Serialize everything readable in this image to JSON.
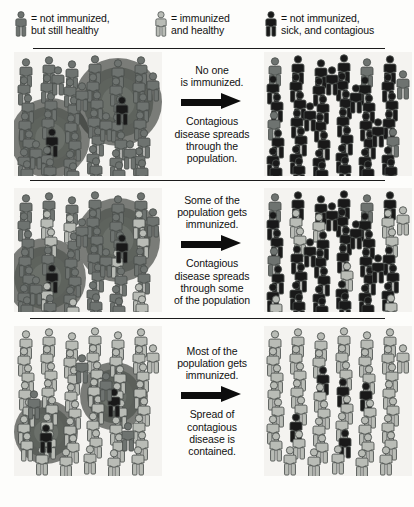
{
  "legend": {
    "items": [
      {
        "icon": "person-icon-healthy-unimmunized",
        "state": "unimmunized_healthy",
        "color": "#6e7370",
        "label": "= not immunized,\nbut still healthy"
      },
      {
        "icon": "person-icon-immunized",
        "state": "immunized_healthy",
        "color": "#b9bcb6",
        "label": "= immunized\nand healthy"
      },
      {
        "icon": "person-icon-sick",
        "state": "sick_contagious",
        "color": "#191919",
        "label": "= not immunized,\nsick, and contagious"
      }
    ]
  },
  "colors": {
    "unimmunized_healthy": "#6e7370",
    "immunized_healthy": "#b9bcb6",
    "sick_contagious": "#191919",
    "outline": "#4a4f4c",
    "panel_background": "#f4f3f0",
    "divider": "#1b1b1b",
    "arrow": "#0d0d0d",
    "text": "#111111"
  },
  "rows": [
    {
      "id": "row-no-immunization",
      "heading": "No one\nis immunized.",
      "arrow_icon": "right-arrow-icon",
      "caption": "Contagious\ndisease spreads\nthrough the\npopulation.",
      "left_panel": {
        "name": "before-panel-row1",
        "counts": {
          "unimmunized_healthy": 46,
          "immunized_healthy": 0,
          "sick_contagious": 2
        },
        "halos": [
          {
            "cx": 36,
            "cy": 86,
            "r": 40
          },
          {
            "cx": 104,
            "cy": 50,
            "r": 44
          }
        ]
      },
      "right_panel": {
        "name": "after-panel-row1",
        "counts": {
          "unimmunized_healthy": 6,
          "immunized_healthy": 0,
          "sick_contagious": 42
        }
      }
    },
    {
      "id": "row-some-immunized",
      "heading": "Some of the\npopulation gets\nimmunized.",
      "arrow_icon": "right-arrow-icon",
      "caption": "Contagious\ndisease spreads\nthrough some\nof the population",
      "left_panel": {
        "name": "before-panel-row2",
        "counts": {
          "unimmunized_healthy": 34,
          "immunized_healthy": 10,
          "sick_contagious": 2
        },
        "halos": [
          {
            "cx": 32,
            "cy": 90,
            "r": 40
          },
          {
            "cx": 104,
            "cy": 52,
            "r": 42
          }
        ]
      },
      "right_panel": {
        "name": "after-panel-row2",
        "counts": {
          "unimmunized_healthy": 3,
          "immunized_healthy": 10,
          "sick_contagious": 35
        }
      }
    },
    {
      "id": "row-most-immunized",
      "heading": "Most of the\npopulation gets\nimmunized.",
      "arrow_icon": "right-arrow-icon",
      "caption": "Spread of\ncontagious\ndisease is\ncontained.",
      "left_panel": {
        "name": "before-panel-row3",
        "counts": {
          "unimmunized_healthy": 4,
          "immunized_healthy": 44,
          "sick_contagious": 2
        },
        "halos": [
          {
            "cx": 32,
            "cy": 106,
            "r": 32
          },
          {
            "cx": 100,
            "cy": 70,
            "r": 34
          }
        ]
      },
      "right_panel": {
        "name": "after-panel-row3",
        "counts": {
          "unimmunized_healthy": 0,
          "immunized_healthy": 46,
          "sick_contagious": 5
        }
      }
    }
  ],
  "figures": {
    "row0_left": [
      [
        4,
        6,
        "u"
      ],
      [
        27,
        4,
        "u"
      ],
      [
        50,
        8,
        "u"
      ],
      [
        73,
        3,
        "u"
      ],
      [
        96,
        7,
        "u"
      ],
      [
        119,
        4,
        "u"
      ],
      [
        131,
        20,
        "u"
      ],
      [
        2,
        24,
        "u"
      ],
      [
        25,
        22,
        "u"
      ],
      [
        48,
        26,
        "u"
      ],
      [
        71,
        21,
        "u"
      ],
      [
        94,
        25,
        "u"
      ],
      [
        117,
        22,
        "u"
      ],
      [
        6,
        42,
        "u"
      ],
      [
        29,
        40,
        "u"
      ],
      [
        52,
        44,
        "u"
      ],
      [
        75,
        39,
        "u"
      ],
      [
        98,
        43,
        "u"
      ],
      [
        121,
        41,
        "u"
      ],
      [
        3,
        60,
        "u"
      ],
      [
        26,
        58,
        "u"
      ],
      [
        49,
        62,
        "u"
      ],
      [
        72,
        57,
        "u"
      ],
      [
        95,
        61,
        "u"
      ],
      [
        118,
        59,
        "u"
      ],
      [
        7,
        78,
        "u"
      ],
      [
        30,
        76,
        "s"
      ],
      [
        53,
        80,
        "u"
      ],
      [
        76,
        75,
        "u"
      ],
      [
        99,
        79,
        "u"
      ],
      [
        122,
        77,
        "u"
      ],
      [
        2,
        96,
        "u"
      ],
      [
        25,
        94,
        "u"
      ],
      [
        48,
        98,
        "u"
      ],
      [
        71,
        93,
        "u"
      ],
      [
        94,
        97,
        "u"
      ],
      [
        117,
        95,
        "u"
      ],
      [
        5,
        108,
        "u"
      ],
      [
        28,
        106,
        "u"
      ],
      [
        51,
        110,
        "u"
      ],
      [
        74,
        105,
        "u"
      ],
      [
        97,
        109,
        "u"
      ],
      [
        120,
        107,
        "u"
      ],
      [
        100,
        44,
        "s"
      ],
      [
        14,
        88,
        "u"
      ],
      [
        60,
        30,
        "u"
      ],
      [
        84,
        60,
        "u"
      ],
      [
        36,
        14,
        "u"
      ],
      [
        108,
        88,
        "u"
      ]
    ],
    "row0_right": [
      [
        3,
        5,
        "u"
      ],
      [
        26,
        3,
        "s"
      ],
      [
        49,
        7,
        "s"
      ],
      [
        72,
        2,
        "s"
      ],
      [
        95,
        6,
        "u"
      ],
      [
        118,
        3,
        "s"
      ],
      [
        131,
        18,
        "u"
      ],
      [
        1,
        23,
        "s"
      ],
      [
        24,
        21,
        "s"
      ],
      [
        47,
        25,
        "s"
      ],
      [
        70,
        20,
        "s"
      ],
      [
        93,
        24,
        "s"
      ],
      [
        116,
        21,
        "s"
      ],
      [
        5,
        41,
        "s"
      ],
      [
        28,
        39,
        "s"
      ],
      [
        51,
        43,
        "s"
      ],
      [
        74,
        38,
        "s"
      ],
      [
        97,
        42,
        "s"
      ],
      [
        120,
        40,
        "s"
      ],
      [
        2,
        59,
        "u"
      ],
      [
        25,
        57,
        "s"
      ],
      [
        48,
        61,
        "s"
      ],
      [
        71,
        56,
        "s"
      ],
      [
        94,
        60,
        "s"
      ],
      [
        117,
        58,
        "s"
      ],
      [
        6,
        77,
        "s"
      ],
      [
        29,
        75,
        "s"
      ],
      [
        52,
        79,
        "s"
      ],
      [
        75,
        74,
        "s"
      ],
      [
        98,
        78,
        "s"
      ],
      [
        121,
        76,
        "u"
      ],
      [
        1,
        95,
        "s"
      ],
      [
        24,
        93,
        "s"
      ],
      [
        47,
        97,
        "s"
      ],
      [
        70,
        92,
        "s"
      ],
      [
        93,
        96,
        "s"
      ],
      [
        116,
        94,
        "s"
      ],
      [
        4,
        107,
        "s"
      ],
      [
        27,
        105,
        "s"
      ],
      [
        50,
        109,
        "s"
      ],
      [
        73,
        104,
        "s"
      ],
      [
        96,
        108,
        "s"
      ],
      [
        119,
        106,
        "s"
      ],
      [
        60,
        14,
        "s"
      ],
      [
        84,
        32,
        "s"
      ],
      [
        38,
        50,
        "s"
      ],
      [
        106,
        66,
        "s"
      ]
    ],
    "row1_left": [
      [
        4,
        6,
        "u"
      ],
      [
        27,
        4,
        "u"
      ],
      [
        50,
        8,
        "u"
      ],
      [
        73,
        3,
        "u"
      ],
      [
        96,
        7,
        "u"
      ],
      [
        119,
        4,
        "u"
      ],
      [
        131,
        20,
        "u"
      ],
      [
        2,
        24,
        "u"
      ],
      [
        25,
        22,
        "i"
      ],
      [
        48,
        26,
        "i"
      ],
      [
        71,
        21,
        "u"
      ],
      [
        94,
        25,
        "u"
      ],
      [
        117,
        22,
        "i"
      ],
      [
        6,
        42,
        "u"
      ],
      [
        29,
        40,
        "i"
      ],
      [
        52,
        44,
        "u"
      ],
      [
        75,
        39,
        "u"
      ],
      [
        98,
        43,
        "u"
      ],
      [
        121,
        41,
        "i"
      ],
      [
        3,
        60,
        "u"
      ],
      [
        26,
        58,
        "u"
      ],
      [
        49,
        62,
        "u"
      ],
      [
        72,
        57,
        "u"
      ],
      [
        95,
        61,
        "i"
      ],
      [
        118,
        59,
        "u"
      ],
      [
        7,
        78,
        "u"
      ],
      [
        30,
        76,
        "s"
      ],
      [
        53,
        80,
        "u"
      ],
      [
        76,
        75,
        "u"
      ],
      [
        99,
        79,
        "u"
      ],
      [
        122,
        77,
        "u"
      ],
      [
        2,
        96,
        "u"
      ],
      [
        25,
        94,
        "i"
      ],
      [
        48,
        98,
        "u"
      ],
      [
        71,
        93,
        "u"
      ],
      [
        94,
        97,
        "u"
      ],
      [
        117,
        95,
        "i"
      ],
      [
        5,
        108,
        "u"
      ],
      [
        28,
        106,
        "u"
      ],
      [
        51,
        110,
        "i"
      ],
      [
        74,
        105,
        "u"
      ],
      [
        97,
        109,
        "u"
      ],
      [
        120,
        107,
        "i"
      ],
      [
        100,
        46,
        "s"
      ],
      [
        14,
        88,
        "u"
      ],
      [
        60,
        30,
        "u"
      ],
      [
        84,
        60,
        "u"
      ]
    ],
    "row1_right": [
      [
        3,
        5,
        "u"
      ],
      [
        26,
        3,
        "s"
      ],
      [
        49,
        7,
        "s"
      ],
      [
        72,
        2,
        "s"
      ],
      [
        95,
        6,
        "u"
      ],
      [
        118,
        3,
        "s"
      ],
      [
        131,
        18,
        "i"
      ],
      [
        1,
        23,
        "s"
      ],
      [
        24,
        21,
        "i"
      ],
      [
        47,
        25,
        "i"
      ],
      [
        70,
        20,
        "s"
      ],
      [
        93,
        24,
        "s"
      ],
      [
        116,
        21,
        "i"
      ],
      [
        5,
        41,
        "s"
      ],
      [
        28,
        39,
        "i"
      ],
      [
        51,
        43,
        "s"
      ],
      [
        74,
        38,
        "s"
      ],
      [
        97,
        42,
        "s"
      ],
      [
        120,
        40,
        "i"
      ],
      [
        2,
        59,
        "u"
      ],
      [
        25,
        57,
        "s"
      ],
      [
        48,
        61,
        "s"
      ],
      [
        71,
        56,
        "s"
      ],
      [
        94,
        60,
        "s"
      ],
      [
        117,
        58,
        "s"
      ],
      [
        6,
        77,
        "s"
      ],
      [
        29,
        75,
        "s"
      ],
      [
        52,
        79,
        "s"
      ],
      [
        75,
        74,
        "i"
      ],
      [
        98,
        78,
        "s"
      ],
      [
        121,
        76,
        "s"
      ],
      [
        1,
        95,
        "s"
      ],
      [
        24,
        93,
        "s"
      ],
      [
        47,
        97,
        "s"
      ],
      [
        70,
        92,
        "s"
      ],
      [
        93,
        96,
        "s"
      ],
      [
        116,
        94,
        "s"
      ],
      [
        4,
        107,
        "i"
      ],
      [
        27,
        105,
        "s"
      ],
      [
        50,
        109,
        "s"
      ],
      [
        73,
        104,
        "s"
      ],
      [
        96,
        108,
        "s"
      ],
      [
        119,
        106,
        "i"
      ],
      [
        60,
        14,
        "s"
      ],
      [
        84,
        32,
        "s"
      ],
      [
        38,
        50,
        "s"
      ],
      [
        106,
        66,
        "s"
      ]
    ],
    "row2_left": [
      [
        4,
        4,
        "i"
      ],
      [
        27,
        2,
        "i"
      ],
      [
        50,
        6,
        "i"
      ],
      [
        73,
        1,
        "i"
      ],
      [
        96,
        5,
        "i"
      ],
      [
        119,
        2,
        "i"
      ],
      [
        131,
        18,
        "i"
      ],
      [
        2,
        21,
        "i"
      ],
      [
        25,
        19,
        "i"
      ],
      [
        48,
        23,
        "i"
      ],
      [
        71,
        18,
        "i"
      ],
      [
        94,
        22,
        "i"
      ],
      [
        117,
        19,
        "i"
      ],
      [
        6,
        38,
        "i"
      ],
      [
        29,
        36,
        "i"
      ],
      [
        52,
        40,
        "i"
      ],
      [
        75,
        35,
        "i"
      ],
      [
        98,
        39,
        "i"
      ],
      [
        121,
        37,
        "i"
      ],
      [
        3,
        55,
        "i"
      ],
      [
        26,
        53,
        "i"
      ],
      [
        49,
        57,
        "i"
      ],
      [
        72,
        52,
        "i"
      ],
      [
        95,
        56,
        "i"
      ],
      [
        118,
        54,
        "i"
      ],
      [
        7,
        72,
        "i"
      ],
      [
        30,
        70,
        "i"
      ],
      [
        53,
        74,
        "i"
      ],
      [
        76,
        69,
        "i"
      ],
      [
        99,
        73,
        "i"
      ],
      [
        122,
        71,
        "i"
      ],
      [
        2,
        89,
        "i"
      ],
      [
        25,
        87,
        "i"
      ],
      [
        48,
        91,
        "i"
      ],
      [
        71,
        86,
        "i"
      ],
      [
        94,
        90,
        "i"
      ],
      [
        117,
        88,
        "i"
      ],
      [
        5,
        106,
        "i"
      ],
      [
        28,
        104,
        "i"
      ],
      [
        51,
        108,
        "i"
      ],
      [
        74,
        103,
        "i"
      ],
      [
        97,
        107,
        "i"
      ],
      [
        120,
        105,
        "i"
      ],
      [
        20,
        120,
        "i"
      ],
      [
        44,
        122,
        "i"
      ],
      [
        68,
        119,
        "i"
      ],
      [
        92,
        123,
        "i"
      ],
      [
        116,
        120,
        "i"
      ],
      [
        24,
        98,
        "s"
      ],
      [
        92,
        62,
        "s"
      ],
      [
        60,
        28,
        "u"
      ],
      [
        84,
        46,
        "u"
      ],
      [
        12,
        64,
        "u"
      ],
      [
        106,
        96,
        "u"
      ]
    ],
    "row2_right": [
      [
        3,
        4,
        "i"
      ],
      [
        26,
        2,
        "i"
      ],
      [
        49,
        6,
        "i"
      ],
      [
        72,
        1,
        "i"
      ],
      [
        95,
        5,
        "i"
      ],
      [
        118,
        2,
        "i"
      ],
      [
        131,
        18,
        "i"
      ],
      [
        1,
        21,
        "i"
      ],
      [
        24,
        19,
        "i"
      ],
      [
        47,
        23,
        "i"
      ],
      [
        70,
        18,
        "i"
      ],
      [
        93,
        22,
        "i"
      ],
      [
        116,
        19,
        "i"
      ],
      [
        5,
        38,
        "i"
      ],
      [
        28,
        36,
        "i"
      ],
      [
        51,
        40,
        "s"
      ],
      [
        74,
        35,
        "i"
      ],
      [
        97,
        39,
        "i"
      ],
      [
        120,
        37,
        "i"
      ],
      [
        2,
        55,
        "i"
      ],
      [
        25,
        53,
        "i"
      ],
      [
        48,
        57,
        "i"
      ],
      [
        71,
        52,
        "s"
      ],
      [
        94,
        56,
        "s"
      ],
      [
        117,
        54,
        "i"
      ],
      [
        6,
        72,
        "i"
      ],
      [
        29,
        70,
        "i"
      ],
      [
        52,
        74,
        "i"
      ],
      [
        75,
        69,
        "i"
      ],
      [
        98,
        73,
        "i"
      ],
      [
        121,
        71,
        "i"
      ],
      [
        1,
        89,
        "i"
      ],
      [
        24,
        87,
        "s"
      ],
      [
        47,
        91,
        "i"
      ],
      [
        70,
        86,
        "i"
      ],
      [
        93,
        90,
        "i"
      ],
      [
        116,
        88,
        "i"
      ],
      [
        4,
        106,
        "i"
      ],
      [
        27,
        104,
        "i"
      ],
      [
        50,
        108,
        "i"
      ],
      [
        73,
        103,
        "s"
      ],
      [
        96,
        107,
        "i"
      ],
      [
        119,
        105,
        "i"
      ],
      [
        18,
        120,
        "i"
      ],
      [
        42,
        122,
        "i"
      ],
      [
        66,
        119,
        "i"
      ],
      [
        90,
        123,
        "i"
      ],
      [
        114,
        120,
        "i"
      ]
    ]
  }
}
